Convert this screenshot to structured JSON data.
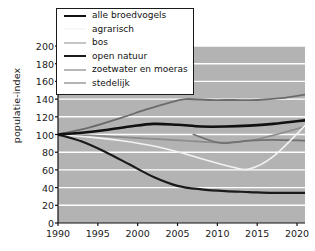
{
  "chart_data": {
    "type": "line",
    "title": "",
    "xlabel": "",
    "ylabel": "populatie-index",
    "xlim": [
      1990,
      2021
    ],
    "ylim": [
      0,
      200
    ],
    "grid": true,
    "legend_position": "top-left",
    "xticks": [
      1990,
      1995,
      2000,
      2005,
      2010,
      2015,
      2020
    ],
    "yticks": [
      0,
      20,
      40,
      60,
      80,
      100,
      120,
      140,
      160,
      180,
      200
    ],
    "series": [
      {
        "name": "alle broedvogels",
        "color": "#111111",
        "width": 2.6,
        "x": [
          1990,
          1993,
          1996,
          1999,
          2002,
          2005,
          2008,
          2011,
          2014,
          2017,
          2021
        ],
        "values": [
          100,
          102,
          105,
          109,
          112,
          111,
          109,
          109,
          110,
          112,
          116
        ]
      },
      {
        "name": "agrarisch",
        "color": "#f2f2f2",
        "width": 1.6,
        "x": [
          1990,
          1994,
          1998,
          2002,
          2006,
          2009,
          2012,
          2014,
          2017,
          2021
        ],
        "values": [
          100,
          97,
          93,
          87,
          78,
          70,
          63,
          61,
          75,
          110
        ]
      },
      {
        "name": "bos",
        "color": "#8c8c8c",
        "width": 1.6,
        "x": [
          1990,
          1994,
          1998,
          2002,
          2006,
          2010,
          2014,
          2017,
          2021
        ],
        "values": [
          100,
          99,
          97,
          95,
          93,
          91,
          93,
          99,
          109
        ]
      },
      {
        "name": "open natuur",
        "color": "#1a1a1a",
        "width": 2.2,
        "x": [
          1990,
          1993,
          1996,
          1999,
          2002,
          2005,
          2008,
          2011,
          2014,
          2017,
          2021
        ],
        "values": [
          100,
          92,
          80,
          66,
          52,
          42,
          38,
          36,
          35,
          34,
          34
        ]
      },
      {
        "name": "zoetwater en moeras",
        "color": "#707070",
        "width": 1.8,
        "x": [
          2007,
          2010,
          2012,
          2014,
          2017,
          2021
        ],
        "values": [
          100,
          91,
          91,
          93,
          94,
          93
        ]
      },
      {
        "name": "stedelijk",
        "color": "#6b6b6b",
        "width": 1.8,
        "x": [
          1990,
          1994,
          1998,
          2001,
          2004,
          2006,
          2009,
          2012,
          2015,
          2018,
          2021
        ],
        "values": [
          100,
          108,
          119,
          128,
          136,
          140,
          139,
          139,
          139,
          141,
          145
        ]
      }
    ]
  },
  "legend": {
    "items": [
      {
        "label": "alle broedvogels"
      },
      {
        "label": "agrarisch"
      },
      {
        "label": "bos"
      },
      {
        "label": "open natuur"
      },
      {
        "label": "zoetwater en moeras"
      },
      {
        "label": "stedelijk"
      }
    ]
  },
  "axis": {
    "y_label": "populatie-index",
    "y_ticks": [
      "200",
      "180",
      "160",
      "140",
      "120",
      "100",
      "80",
      "60",
      "40",
      "20",
      "0"
    ],
    "x_ticks": [
      "1990",
      "1995",
      "2000",
      "2005",
      "2010",
      "2015",
      "2020"
    ]
  }
}
